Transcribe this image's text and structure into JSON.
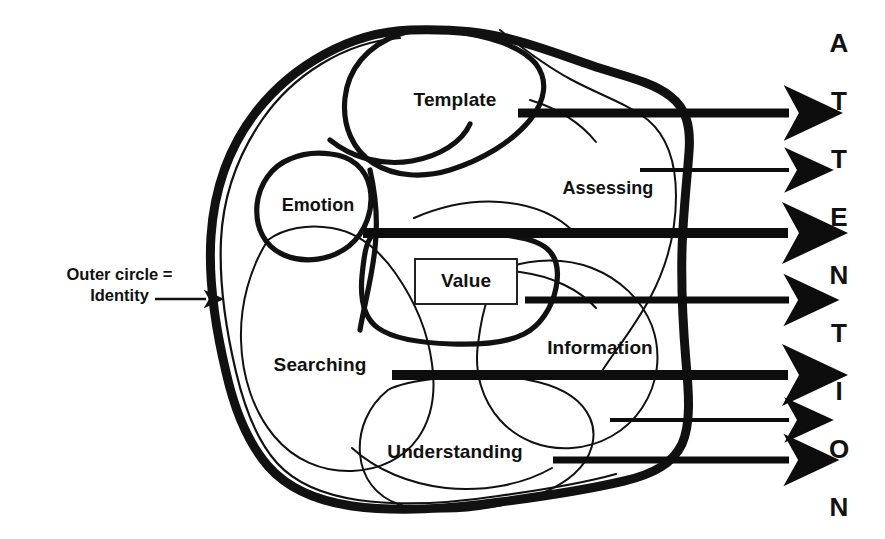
{
  "diagram": {
    "background_color": "#ffffff",
    "ink_color": "#111111",
    "annotation": {
      "line1": "Outer circle =",
      "line2": "Identity",
      "pointer_icon": "arrow-right-icon"
    },
    "regions": [
      {
        "id": "template",
        "label": "Template",
        "x": 455,
        "y": 100
      },
      {
        "id": "emotion",
        "label": "Emotion",
        "x": 318,
        "y": 205
      },
      {
        "id": "assessing",
        "label": "Assessing",
        "x": 608,
        "y": 188
      },
      {
        "id": "value",
        "label": "Value",
        "x": 466,
        "y": 281
      },
      {
        "id": "searching",
        "label": "Searching",
        "x": 320,
        "y": 365
      },
      {
        "id": "information",
        "label": "Information",
        "x": 600,
        "y": 348
      },
      {
        "id": "understanding",
        "label": "Understanding",
        "x": 455,
        "y": 452
      }
    ],
    "value_box": {
      "x": 415,
      "y": 259,
      "width": 102,
      "height": 45
    },
    "arrows": [
      {
        "id": "arrow-1",
        "x_start": 518,
        "x_end": 797,
        "y": 113,
        "thickness": 9,
        "head": "thick"
      },
      {
        "id": "arrow-2",
        "x_start": 640,
        "x_end": 797,
        "y": 170,
        "thickness": 4,
        "head": "thin"
      },
      {
        "id": "arrow-3",
        "x_start": 363,
        "x_end": 797,
        "y": 233,
        "thickness": 10,
        "head": "thick"
      },
      {
        "id": "arrow-4",
        "x_start": 525,
        "x_end": 797,
        "y": 300,
        "thickness": 7,
        "head": "medium"
      },
      {
        "id": "arrow-5",
        "x_start": 392,
        "x_end": 797,
        "y": 375,
        "thickness": 10,
        "head": "thick"
      },
      {
        "id": "arrow-6",
        "x_start": 610,
        "x_end": 797,
        "y": 420,
        "thickness": 4,
        "head": "thin"
      },
      {
        "id": "arrow-7",
        "x_start": 553,
        "x_end": 797,
        "y": 460,
        "thickness": 7,
        "head": "medium"
      }
    ],
    "attention_letters": [
      "A",
      "T",
      "T",
      "E",
      "N",
      "T",
      "I",
      "O",
      "N"
    ],
    "attention_word": "ATTENTION"
  }
}
